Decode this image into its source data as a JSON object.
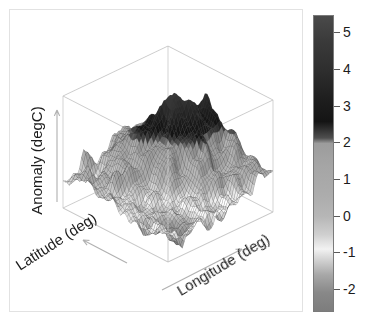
{
  "figure": {
    "background_color": "#ffffff",
    "frame_color": "#e2e2e2",
    "width": 374,
    "height": 329
  },
  "axes": {
    "z": {
      "label": "Anomaly (degC)",
      "arrow": "up-arrow-icon",
      "arrow_direction": "up"
    },
    "x": {
      "label": "Latitude (deg)",
      "arrow": "up-left-arrow-icon",
      "arrow_direction": "up-left"
    },
    "y": {
      "label": "Longitude (deg)",
      "arrow": "up-right-arrow-icon",
      "arrow_direction": "up-right"
    }
  },
  "colorbar": {
    "orientation": "vertical",
    "vmin": -2.6,
    "vmax": 5.5,
    "tick_values": [
      5,
      4,
      3,
      2,
      1,
      0,
      -1,
      -2
    ],
    "tick_labels": [
      "5",
      "4",
      "3",
      "2",
      "1",
      "0",
      "-1",
      "-2"
    ],
    "border_color": "#7a7a7a",
    "tick_color": "#5a5a5a",
    "label_color": "#1c1c1c",
    "stops": [
      {
        "value": 5.5,
        "color": "#4a4a4a"
      },
      {
        "value": 4.8,
        "color": "#3a3a3a"
      },
      {
        "value": 4.0,
        "color": "#2e2e2e"
      },
      {
        "value": 3.2,
        "color": "#1e1e1e"
      },
      {
        "value": 2.6,
        "color": "#141414"
      },
      {
        "value": 2.15,
        "color": "#4f4f4f"
      },
      {
        "value": 2.0,
        "color": "#9c9c9c"
      },
      {
        "value": 1.4,
        "color": "#a5a5a5"
      },
      {
        "value": 0.6,
        "color": "#acacac"
      },
      {
        "value": 0.0,
        "color": "#b6b6b6"
      },
      {
        "value": -0.5,
        "color": "#cfcfcf"
      },
      {
        "value": -0.9,
        "color": "#f2f2f2"
      },
      {
        "value": -1.1,
        "color": "#dcdcdc"
      },
      {
        "value": -1.6,
        "color": "#a8a8a8"
      },
      {
        "value": -2.1,
        "color": "#888888"
      },
      {
        "value": -2.6,
        "color": "#7d7d7d"
      }
    ]
  },
  "chart_data": {
    "type": "surface",
    "title": "",
    "xlabel": "Latitude (deg)",
    "ylabel": "Longitude (deg)",
    "zlabel": "Anomaly (degC)",
    "colorbar_label": "Anomaly (degC)",
    "zlim": [
      -2.6,
      5.5
    ],
    "grid": false,
    "legend": "none",
    "mesh": {
      "nx": 52,
      "ny": 52,
      "style": "wireframe-shaded",
      "line_color": "#555555",
      "surface_color_map": "grayscale-inverted"
    },
    "summary_values": {
      "peak_anomaly": 5.2,
      "min_anomaly": -2.3,
      "mean_anomaly": 0.6
    }
  },
  "box": {
    "edge_color": "#c8c8c8",
    "corners_projected": {
      "front_bottom": [
        168,
        262
      ],
      "left_bottom": [
        63,
        208
      ],
      "right_bottom": [
        264,
        212
      ],
      "back_bottom": [
        160,
        163
      ],
      "front_top": [
        168,
        150
      ],
      "left_top": [
        63,
        96
      ],
      "right_top": [
        264,
        100
      ],
      "back_top": [
        160,
        51
      ]
    }
  }
}
